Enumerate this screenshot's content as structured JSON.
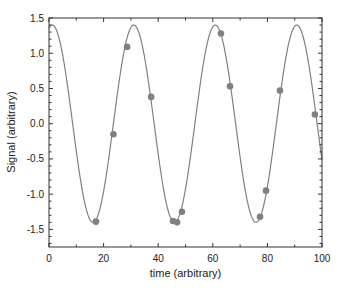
{
  "chart_data": {
    "type": "scatter",
    "title": "",
    "xlabel": "time (arbitrary)",
    "ylabel": "Signal (arbitrary)",
    "xlim": [
      0,
      100
    ],
    "ylim": [
      -1.75,
      1.5
    ],
    "x_ticks": [
      0,
      20,
      40,
      60,
      80,
      100
    ],
    "x_tick_labels": [
      "0",
      "20",
      "40",
      "60",
      "80",
      "100"
    ],
    "y_ticks": [
      -1.5,
      -1.0,
      -0.5,
      0.0,
      0.5,
      1.0,
      1.5
    ],
    "y_tick_labels": [
      "-1.5",
      "-1.0",
      "-0.5",
      "0.0",
      "0.5",
      "1.0",
      "1.5"
    ],
    "grid": false,
    "legend": null,
    "series": [
      {
        "name": "samples",
        "kind": "scatter",
        "color": "#808080",
        "x": [
          17.2,
          23.6,
          28.6,
          37.4,
          45.4,
          46.9,
          48.7,
          63.0,
          66.3,
          77.3,
          79.5,
          84.6,
          97.4
        ],
        "y": [
          -1.39,
          -0.15,
          1.09,
          0.38,
          -1.38,
          -1.4,
          -1.25,
          1.28,
          0.53,
          -1.32,
          -0.95,
          0.47,
          0.13
        ]
      },
      {
        "name": "fit",
        "kind": "line",
        "color": "#808080",
        "function": "1.4*cos(2*pi*(x-1.2)/29.85)",
        "amplitude": 1.4,
        "period": 29.85,
        "phase_x": 1.2
      }
    ]
  }
}
